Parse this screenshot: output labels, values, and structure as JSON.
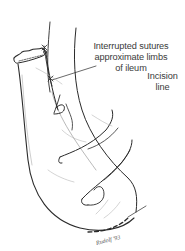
{
  "figure": {
    "colors": {
      "ink": "#2a2a2a",
      "shading": "#9a9a9a",
      "label_text": "#3a3a3a",
      "background": "#ffffff"
    }
  },
  "annotations": {
    "sutures": {
      "lines": [
        "Interrupted sutures",
        "approximate limbs",
        "of ileum"
      ]
    },
    "incision": {
      "lines": [
        "Incision",
        "line"
      ]
    }
  },
  "signature": {
    "text": "Rudolf '93"
  }
}
